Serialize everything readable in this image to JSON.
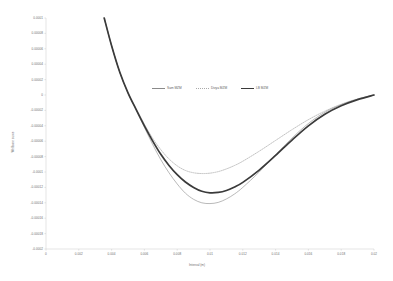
{
  "chart_data": {
    "type": "line",
    "title": "",
    "xlabel": "Interval (m)",
    "ylabel": "Wellbore curve",
    "xlim": [
      0,
      0.02
    ],
    "ylim": [
      -0.0002,
      0.0001
    ],
    "grid": false,
    "legend_position": "upper-center",
    "x_ticks": [
      "0",
      "0.002",
      "0.004",
      "0.006",
      "0.008",
      "0.01",
      "0.012",
      "0.014",
      "0.016",
      "0.018",
      "0.02"
    ],
    "x_tick_values": [
      0,
      0.002,
      0.004,
      0.006,
      0.008,
      0.01,
      0.012,
      0.014,
      0.016,
      0.018,
      0.02
    ],
    "y_ticks": [
      "0.0001",
      "0.00008",
      "0.00006",
      "0.00004",
      "0.00002",
      "0",
      "-0.00002",
      "-0.00004",
      "-0.00006",
      "-0.00008",
      "-0.0001",
      "-0.00012",
      "-0.00014",
      "-0.00016",
      "-0.00018",
      "-0.0002"
    ],
    "y_tick_values": [
      0.0001,
      8e-05,
      6e-05,
      4e-05,
      2e-05,
      0,
      -2e-05,
      -4e-05,
      -6e-05,
      -8e-05,
      -0.0001,
      -0.00012,
      -0.00014,
      -0.00016,
      -0.00018,
      -0.0002
    ],
    "series": [
      {
        "name": "Sam MZM",
        "style": "solid-thin",
        "color": "#8a8a8a",
        "x": [
          0.00355,
          0.004,
          0.0045,
          0.005,
          0.0055,
          0.006,
          0.0065,
          0.007,
          0.0075,
          0.008,
          0.0085,
          0.009,
          0.0095,
          0.01,
          0.0105,
          0.011,
          0.0115,
          0.012,
          0.013,
          0.014,
          0.015,
          0.016,
          0.017,
          0.018,
          0.019,
          0.02
        ],
        "y": [
          0.0001,
          6.4e-05,
          2.95e-05,
          2.5e-06,
          -1.95e-05,
          -4.2e-05,
          -6.4e-05,
          -8.4e-05,
          -0.000101,
          -0.0001155,
          -0.0001275,
          -0.0001355,
          -0.00014,
          -0.000141,
          -0.0001395,
          -0.000135,
          -0.0001285,
          -0.00012,
          -0.0001,
          -7.75e-05,
          -5.6e-05,
          -3.7e-05,
          -2.25e-05,
          -1.25e-05,
          -5.5e-06,
          0.0
        ]
      },
      {
        "name": "Divya MZM",
        "style": "dotted",
        "color": "#a9a9a9",
        "x": [
          0.00355,
          0.004,
          0.0045,
          0.005,
          0.0055,
          0.006,
          0.0065,
          0.007,
          0.0075,
          0.008,
          0.0085,
          0.009,
          0.0095,
          0.01,
          0.0105,
          0.011,
          0.0115,
          0.012,
          0.013,
          0.014,
          0.015,
          0.016,
          0.017,
          0.018,
          0.019,
          0.02
        ],
        "y": [
          0.0001,
          6.4e-05,
          2.95e-05,
          3e-06,
          -1.8e-05,
          -3.8e-05,
          -5.6e-05,
          -7.1e-05,
          -8.3e-05,
          -9.2e-05,
          -9.8e-05,
          -0.000101,
          -0.000102,
          -0.0001015,
          -9.95e-05,
          -9.6e-05,
          -9.15e-05,
          -8.6e-05,
          -7.3e-05,
          -5.9e-05,
          -4.5e-05,
          -3.2e-05,
          -2.1e-05,
          -1.2e-05,
          -5e-06,
          0.0
        ]
      },
      {
        "name": "LB MZM",
        "style": "solid-thick",
        "color": "#3a3a3a",
        "x": [
          0.00355,
          0.004,
          0.0045,
          0.005,
          0.0055,
          0.006,
          0.0065,
          0.007,
          0.0075,
          0.008,
          0.0085,
          0.009,
          0.0095,
          0.01,
          0.0105,
          0.011,
          0.0115,
          0.012,
          0.013,
          0.014,
          0.015,
          0.016,
          0.017,
          0.018,
          0.019,
          0.02
        ],
        "y": [
          0.0001,
          6.4e-05,
          2.95e-05,
          2.8e-06,
          -1.9e-05,
          -4e-05,
          -5.95e-05,
          -7.7e-05,
          -9.15e-05,
          -0.0001035,
          -0.000113,
          -0.00012,
          -0.000125,
          -0.000127,
          -0.0001265,
          -0.000124,
          -0.0001195,
          -0.0001135,
          -9.75e-05,
          -7.85e-05,
          -5.85e-05,
          -4e-05,
          -2.5e-05,
          -1.4e-05,
          -6e-06,
          0.0
        ]
      }
    ]
  }
}
